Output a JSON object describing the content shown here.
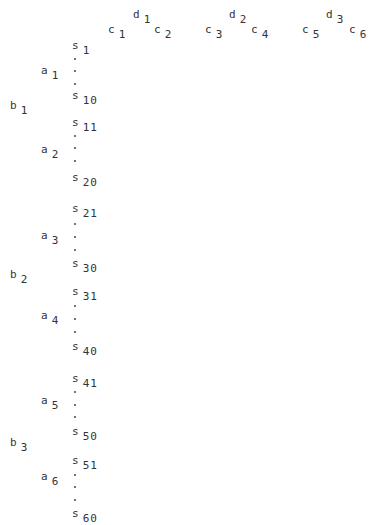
{
  "header": {
    "groups": [
      {
        "d": {
          "base": "d",
          "sub": "1",
          "x": 133,
          "y": 9
        },
        "c": [
          {
            "base": "c",
            "sub": "1",
            "x": 108,
            "y": 24
          },
          {
            "base": "c",
            "sub": "2",
            "x": 154,
            "y": 24
          }
        ]
      },
      {
        "d": {
          "base": "d",
          "sub": "2",
          "x": 229,
          "y": 9
        },
        "c": [
          {
            "base": "c",
            "sub": "3",
            "x": 205,
            "y": 24
          },
          {
            "base": "c",
            "sub": "4",
            "x": 251,
            "y": 24
          }
        ]
      },
      {
        "d": {
          "base": "d",
          "sub": "3",
          "x": 326,
          "y": 9
        },
        "c": [
          {
            "base": "c",
            "sub": "5",
            "x": 302,
            "y": 24
          },
          {
            "base": "c",
            "sub": "6",
            "x": 349,
            "y": 24
          }
        ]
      }
    ]
  },
  "rows": {
    "b": [
      {
        "base": "b",
        "sub": "1",
        "x": 10,
        "y": 100
      },
      {
        "base": "b",
        "sub": "2",
        "x": 10,
        "y": 269
      },
      {
        "base": "b",
        "sub": "3",
        "x": 10,
        "y": 437
      }
    ],
    "a": [
      {
        "base": "a",
        "sub": "1",
        "x": 41,
        "y": 65
      },
      {
        "base": "a",
        "sub": "2",
        "x": 41,
        "y": 144
      },
      {
        "base": "a",
        "sub": "3",
        "x": 41,
        "y": 230
      },
      {
        "base": "a",
        "sub": "4",
        "x": 41,
        "y": 310
      },
      {
        "base": "a",
        "sub": "5",
        "x": 41,
        "y": 395
      },
      {
        "base": "a",
        "sub": "6",
        "x": 41,
        "y": 471
      }
    ],
    "s": [
      {
        "base": "s",
        "sub": "1",
        "x": 72,
        "y": 40
      },
      {
        "base": "s",
        "sub": "10",
        "x": 72,
        "y": 90
      },
      {
        "base": "s",
        "sub": "11",
        "x": 72,
        "y": 117
      },
      {
        "base": "s",
        "sub": "20",
        "x": 72,
        "y": 172
      },
      {
        "base": "s",
        "sub": "21",
        "x": 72,
        "y": 203
      },
      {
        "base": "s",
        "sub": "30",
        "x": 72,
        "y": 258
      },
      {
        "base": "s",
        "sub": "31",
        "x": 72,
        "y": 286
      },
      {
        "base": "s",
        "sub": "40",
        "x": 72,
        "y": 341
      },
      {
        "base": "s",
        "sub": "41",
        "x": 72,
        "y": 373
      },
      {
        "base": "s",
        "sub": "50",
        "x": 72,
        "y": 426
      },
      {
        "base": "s",
        "sub": "51",
        "x": 72,
        "y": 455
      },
      {
        "base": "s",
        "sub": "60",
        "x": 72,
        "y": 508
      }
    ],
    "ellipsis_dots_y": [
      58,
      70,
      83,
      135,
      147,
      160,
      223,
      236,
      249,
      305,
      318,
      331,
      391,
      404,
      416,
      474,
      486,
      499
    ],
    "ellipsis_x": 74
  }
}
